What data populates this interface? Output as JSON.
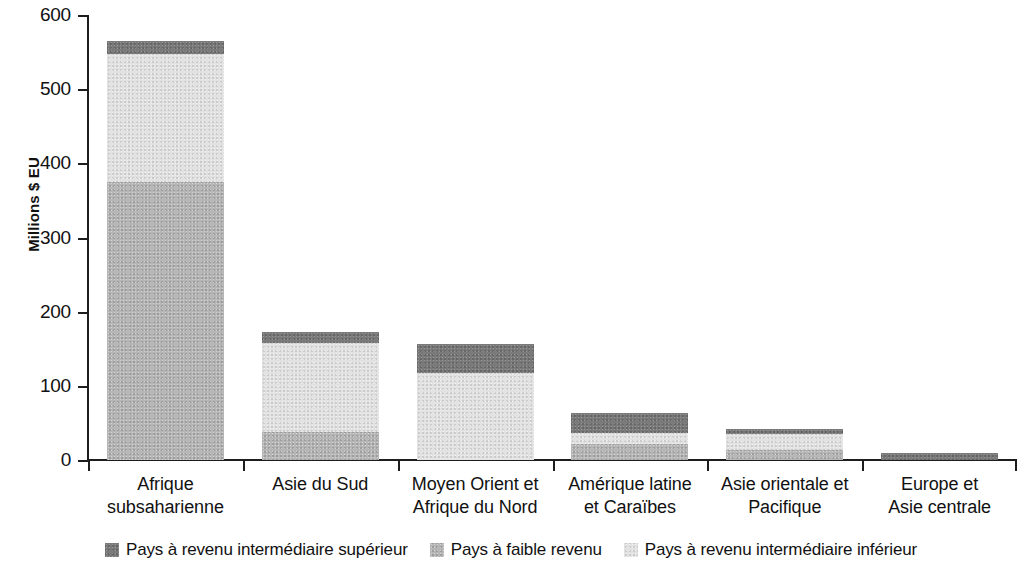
{
  "chart_data": {
    "type": "bar",
    "subtype": "stacked-bar",
    "title": "",
    "subtitle": "",
    "xlabel": "",
    "ylabel": "Millions $ EU",
    "ylim": [
      0,
      600
    ],
    "yticks": [
      0,
      100,
      200,
      300,
      400,
      500,
      600
    ],
    "ytick_labels": [
      "0",
      "100",
      "200",
      "300",
      "400",
      "500",
      "600"
    ],
    "grid": false,
    "legend_position": "bottom",
    "categories": [
      "Afrique subsaharienne",
      "Asie du Sud",
      "Moyen Orient et Afrique du Nord",
      "Amérique latine et Caraïbes",
      "Asie orientale et Pacifique",
      "Europe et Asie centrale"
    ],
    "category_lines": [
      [
        "Afrique",
        "subsaharienne"
      ],
      [
        "Asie du Sud",
        ""
      ],
      [
        "Moyen Orient et",
        "Afrique du Nord"
      ],
      [
        "Amérique latine",
        "et Caraïbes"
      ],
      [
        "Asie orientale et",
        "Pacifique"
      ],
      [
        "Europe et",
        "Asie centrale"
      ]
    ],
    "series": [
      {
        "name": "Pays à faible revenu",
        "key": "low",
        "color": "#b6b6b6",
        "values": [
          375,
          38,
          0,
          21,
          13,
          0
        ]
      },
      {
        "name": "Pays à revenu intermédiaire inférieur",
        "key": "lower_middle",
        "color": "#e2e2e2",
        "values": [
          172,
          120,
          117,
          15,
          22,
          0
        ]
      },
      {
        "name": "Pays à revenu intermédiaire supérieur",
        "key": "upper_middle",
        "color": "#7a7a7a",
        "values": [
          18,
          14,
          39,
          27,
          7,
          10
        ]
      }
    ],
    "stack_order_bottom_to_top": [
      "low",
      "lower_middle",
      "upper_middle"
    ],
    "totals": [
      565,
      172,
      156,
      63,
      42,
      10
    ]
  },
  "legend": {
    "items": [
      {
        "label": "Pays à revenu intermédiaire supérieur",
        "color": "#7a7a7a",
        "key": "upper_middle"
      },
      {
        "label": "Pays à faible revenu",
        "color": "#b6b6b6",
        "key": "low"
      },
      {
        "label": "Pays à revenu intermédiaire inférieur",
        "color": "#e2e2e2",
        "key": "lower_middle"
      }
    ]
  },
  "axis": {
    "y_title": "Millions $ EU"
  }
}
